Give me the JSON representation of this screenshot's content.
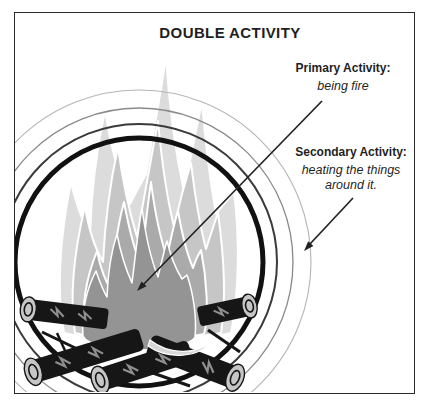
{
  "title": "DOUBLE ACTIVITY",
  "annotations": {
    "primary": {
      "heading": "Primary Activity:",
      "description": "being fire"
    },
    "secondary": {
      "heading": "Secondary Activity:",
      "description_line1": "heating the things",
      "description_line2": "around it."
    }
  },
  "illustration": {
    "subject": "campfire surrounded by concentric heat rings",
    "ring_count": 4,
    "log_count": 5,
    "colors": {
      "ink": "#1f1f1f",
      "frame_border": "#2a2a2a",
      "flame_back": "#dcdcdc",
      "flame_outer": "#c6c6c6",
      "flame_middle": "#aaaaaa",
      "flame_inner": "#949494",
      "flame_curl": "#d7d7d7",
      "log_body": "#161616",
      "log_end_cap": "#c6c6c6",
      "ring_thick": "#111111",
      "ring_medium": "#3a3a3a",
      "ring_thin": "#8a8a8a",
      "ring_faint": "#b5b5b5",
      "arrow": "#222222"
    }
  }
}
